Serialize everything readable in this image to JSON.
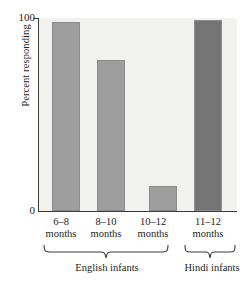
{
  "chart_data": {
    "type": "bar",
    "title": "",
    "xlabel": "",
    "ylabel": "Percent responding",
    "ylim": [
      0,
      100
    ],
    "yticks": [
      "0",
      "100"
    ],
    "grid": false,
    "legend": false,
    "categories": [
      "6–8\nmonths",
      "8–10\nmonths",
      "10–12\nmonths",
      "11–12\nmonths"
    ],
    "values": [
      98,
      78,
      13,
      99
    ],
    "bar_colors": [
      "#9e9e9e",
      "#9e9e9e",
      "#9e9e9e",
      "#757575"
    ],
    "groups": [
      {
        "label": "English infants",
        "categories": [
          "6–8 months",
          "8–10 months",
          "10–12 months"
        ]
      },
      {
        "label": "Hindi infants",
        "categories": [
          "11–12 months"
        ]
      }
    ],
    "plot_background": "#f2f2f0",
    "axis_color": "#3c3c3c"
  },
  "axis": {
    "y_label": "Percent responding",
    "y_tick_top": "100",
    "y_tick_bottom": "0"
  },
  "categories": [
    {
      "line1": "6–8",
      "line2": "months"
    },
    {
      "line1": "8–10",
      "line2": "months"
    },
    {
      "line1": "10–12",
      "line2": "months"
    },
    {
      "line1": "11–12",
      "line2": "months"
    }
  ],
  "groups": [
    {
      "label": "English infants"
    },
    {
      "label": "Hindi infants"
    }
  ]
}
